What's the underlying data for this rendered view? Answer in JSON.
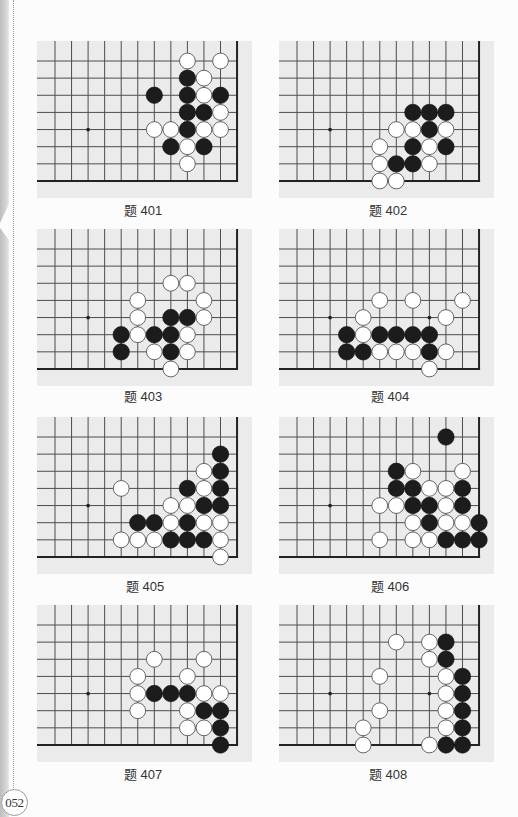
{
  "page": {
    "number": "052"
  },
  "board_config": {
    "visible_cols": 12,
    "visible_rows": 8,
    "edges": [
      "right",
      "bottom"
    ],
    "star_points": [
      [
        2,
        4
      ],
      [
        8,
        4
      ]
    ],
    "colors": {
      "board": "#ebebeb",
      "line": "#4d4d4d",
      "edge": "#222222",
      "black_stone": "#1c1c1c",
      "white_stone": "#ffffff",
      "white_outline": "#555555",
      "star": "#222222"
    }
  },
  "problems": [
    {
      "label": "题 401",
      "stones": {
        "black": [
          [
            8,
            1
          ],
          [
            6,
            2
          ],
          [
            8,
            2
          ],
          [
            10,
            2
          ],
          [
            8,
            3
          ],
          [
            9,
            3
          ],
          [
            8,
            4
          ],
          [
            7,
            5
          ],
          [
            9,
            5
          ]
        ],
        "white": [
          [
            8,
            0
          ],
          [
            10,
            0
          ],
          [
            9,
            1
          ],
          [
            9,
            2
          ],
          [
            10,
            3
          ],
          [
            6,
            4
          ],
          [
            7,
            4
          ],
          [
            9,
            4
          ],
          [
            10,
            4
          ],
          [
            8,
            5
          ],
          [
            8,
            6
          ]
        ]
      }
    },
    {
      "label": "题 402",
      "stones": {
        "black": [
          [
            7,
            3
          ],
          [
            8,
            3
          ],
          [
            9,
            3
          ],
          [
            8,
            4
          ],
          [
            7,
            5
          ],
          [
            9,
            5
          ],
          [
            6,
            6
          ],
          [
            7,
            6
          ]
        ],
        "white": [
          [
            6,
            4
          ],
          [
            7,
            4
          ],
          [
            9,
            4
          ],
          [
            5,
            5
          ],
          [
            8,
            5
          ],
          [
            5,
            6
          ],
          [
            8,
            6
          ],
          [
            5,
            7
          ],
          [
            6,
            7
          ]
        ]
      }
    },
    {
      "label": "题 403",
      "stones": {
        "black": [
          [
            7,
            4
          ],
          [
            8,
            4
          ],
          [
            4,
            5
          ],
          [
            6,
            5
          ],
          [
            7,
            5
          ],
          [
            4,
            6
          ],
          [
            7,
            6
          ]
        ],
        "white": [
          [
            7,
            2
          ],
          [
            8,
            2
          ],
          [
            5,
            3
          ],
          [
            9,
            3
          ],
          [
            5,
            4
          ],
          [
            9,
            4
          ],
          [
            5,
            5
          ],
          [
            8,
            5
          ],
          [
            6,
            6
          ],
          [
            8,
            6
          ],
          [
            7,
            7
          ]
        ]
      }
    },
    {
      "label": "题 404",
      "stones": {
        "black": [
          [
            3,
            5
          ],
          [
            5,
            5
          ],
          [
            6,
            5
          ],
          [
            7,
            5
          ],
          [
            8,
            5
          ],
          [
            3,
            6
          ],
          [
            4,
            6
          ],
          [
            8,
            6
          ]
        ],
        "white": [
          [
            5,
            3
          ],
          [
            7,
            3
          ],
          [
            10,
            3
          ],
          [
            4,
            4
          ],
          [
            9,
            4
          ],
          [
            4,
            5
          ],
          [
            5,
            6
          ],
          [
            6,
            6
          ],
          [
            7,
            6
          ],
          [
            9,
            6
          ],
          [
            8,
            7
          ]
        ]
      }
    },
    {
      "label": "题 405",
      "stones": {
        "black": [
          [
            10,
            1
          ],
          [
            10,
            2
          ],
          [
            8,
            3
          ],
          [
            10,
            3
          ],
          [
            9,
            4
          ],
          [
            10,
            4
          ],
          [
            5,
            5
          ],
          [
            6,
            5
          ],
          [
            8,
            5
          ],
          [
            7,
            6
          ],
          [
            8,
            6
          ],
          [
            9,
            6
          ]
        ],
        "white": [
          [
            9,
            2
          ],
          [
            4,
            3
          ],
          [
            9,
            3
          ],
          [
            7,
            4
          ],
          [
            8,
            4
          ],
          [
            7,
            5
          ],
          [
            9,
            5
          ],
          [
            10,
            5
          ],
          [
            4,
            6
          ],
          [
            5,
            6
          ],
          [
            6,
            6
          ],
          [
            10,
            6
          ],
          [
            10,
            7
          ]
        ]
      }
    },
    {
      "label": "题 406",
      "stones": {
        "black": [
          [
            9,
            0
          ],
          [
            6,
            2
          ],
          [
            6,
            3
          ],
          [
            7,
            3
          ],
          [
            10,
            3
          ],
          [
            7,
            4
          ],
          [
            8,
            4
          ],
          [
            10,
            4
          ],
          [
            8,
            5
          ],
          [
            11,
            5
          ],
          [
            9,
            6
          ],
          [
            10,
            6
          ],
          [
            11,
            6
          ]
        ],
        "white": [
          [
            7,
            2
          ],
          [
            10,
            2
          ],
          [
            8,
            3
          ],
          [
            9,
            3
          ],
          [
            5,
            4
          ],
          [
            6,
            4
          ],
          [
            9,
            4
          ],
          [
            7,
            5
          ],
          [
            9,
            5
          ],
          [
            10,
            5
          ],
          [
            5,
            6
          ],
          [
            7,
            6
          ],
          [
            8,
            6
          ]
        ]
      }
    },
    {
      "label": "题 407",
      "stones": {
        "black": [
          [
            6,
            4
          ],
          [
            7,
            4
          ],
          [
            8,
            4
          ],
          [
            9,
            5
          ],
          [
            10,
            5
          ],
          [
            10,
            6
          ],
          [
            10,
            7
          ]
        ],
        "white": [
          [
            6,
            2
          ],
          [
            9,
            2
          ],
          [
            5,
            3
          ],
          [
            8,
            3
          ],
          [
            5,
            4
          ],
          [
            9,
            4
          ],
          [
            10,
            4
          ],
          [
            5,
            5
          ],
          [
            8,
            5
          ],
          [
            8,
            6
          ],
          [
            9,
            6
          ]
        ]
      }
    },
    {
      "label": "题 408",
      "stones": {
        "black": [
          [
            9,
            1
          ],
          [
            9,
            2
          ],
          [
            10,
            3
          ],
          [
            10,
            4
          ],
          [
            10,
            5
          ],
          [
            10,
            6
          ],
          [
            9,
            7
          ],
          [
            10,
            7
          ]
        ],
        "white": [
          [
            6,
            1
          ],
          [
            8,
            1
          ],
          [
            8,
            2
          ],
          [
            5,
            3
          ],
          [
            9,
            3
          ],
          [
            9,
            4
          ],
          [
            5,
            5
          ],
          [
            9,
            5
          ],
          [
            4,
            6
          ],
          [
            9,
            6
          ],
          [
            4,
            7
          ],
          [
            8,
            7
          ]
        ]
      }
    }
  ]
}
